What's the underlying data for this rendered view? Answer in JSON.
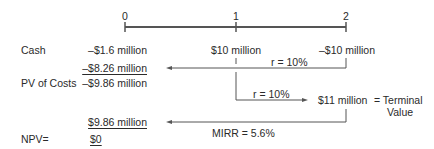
{
  "timeline": {
    "periods": [
      "0",
      "1",
      "2"
    ]
  },
  "rows": {
    "cash_label": "Cash",
    "cash_0": "–$1.6 million",
    "cash_1": "$10 million",
    "cash_2": "–$10 million",
    "discounted_cost": "–$8.26 million",
    "pv_costs_label": "PV of Costs",
    "pv_costs_value": "–$9.86 million",
    "pv_terminal": "$9.86 million",
    "npv_label": "NPV=",
    "npv_value": "$0"
  },
  "annotations": {
    "rate_discount": "r = 10%",
    "rate_compound": "r = 10%",
    "terminal_value_amount": "$11 million",
    "terminal_value_label_line1": "= Terminal",
    "terminal_value_label_line2": "Value",
    "mirr": "MIRR = 5.6%"
  }
}
